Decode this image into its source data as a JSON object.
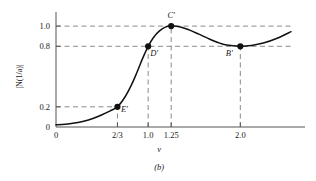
{
  "figure": {
    "caption": "(b)",
    "background": "#ffffff",
    "line_color": "#1a1a1a",
    "dash_color": "#8a8a8a"
  },
  "chart_data": {
    "type": "line",
    "title": "",
    "subtitle": "",
    "xlabel": "v",
    "ylabel": "|N(1/a)|",
    "xlim": [
      0,
      2.55
    ],
    "ylim": [
      0,
      1.12
    ],
    "grid": false,
    "legend": null,
    "xticks": [
      {
        "value": 0,
        "label": "0"
      },
      {
        "value": 0.6667,
        "label": "2/3"
      },
      {
        "value": 1.0,
        "label": "1.0"
      },
      {
        "value": 1.25,
        "label": "1.25"
      },
      {
        "value": 2.0,
        "label": "2.0"
      }
    ],
    "yticks": [
      {
        "value": 0,
        "label": "0"
      },
      {
        "value": 0.2,
        "label": "0.2"
      },
      {
        "value": 0.8,
        "label": "0.8"
      },
      {
        "value": 1.0,
        "label": "1.0"
      }
    ],
    "series": [
      {
        "name": "|N(1/a)|",
        "x": [
          0.0,
          0.1,
          0.2,
          0.3,
          0.4,
          0.5,
          0.5833,
          0.6667,
          0.75,
          0.82,
          0.88,
          0.94,
          1.0,
          1.06,
          1.12,
          1.18,
          1.25,
          1.35,
          1.45,
          1.55,
          1.65,
          1.75,
          1.85,
          2.0,
          2.12,
          2.25,
          2.4,
          2.55
        ],
        "y": [
          0.022,
          0.028,
          0.04,
          0.058,
          0.085,
          0.122,
          0.158,
          0.2,
          0.3,
          0.42,
          0.545,
          0.68,
          0.8,
          0.89,
          0.95,
          0.988,
          1.0,
          0.992,
          0.96,
          0.92,
          0.878,
          0.84,
          0.812,
          0.8,
          0.808,
          0.832,
          0.88,
          0.945
        ]
      }
    ],
    "markers": [
      {
        "id": "E",
        "label": "E'",
        "x": 0.6667,
        "y": 0.2,
        "label_dx": 7,
        "label_dy": 5
      },
      {
        "id": "D",
        "label": "D'",
        "x": 1.0,
        "y": 0.8,
        "label_dx": 6,
        "label_dy": 10
      },
      {
        "id": "C",
        "label": "C'",
        "x": 1.25,
        "y": 1.0,
        "label_dx": 0,
        "label_dy": -8
      },
      {
        "id": "B",
        "label": "B'",
        "x": 2.0,
        "y": 0.8,
        "label_dx": -11,
        "label_dy": 10
      }
    ],
    "guide_lines": [
      {
        "orientation": "horizontal",
        "value": 1.0,
        "from": 0,
        "to": 2.55
      },
      {
        "orientation": "horizontal",
        "value": 0.8,
        "from": 0,
        "to": 2.55
      },
      {
        "orientation": "horizontal",
        "value": 0.2,
        "from": 0,
        "to": 0.6667
      },
      {
        "orientation": "vertical",
        "value": 0.6667,
        "from": 0,
        "to": 0.2
      },
      {
        "orientation": "vertical",
        "value": 1.0,
        "from": 0,
        "to": 0.8
      },
      {
        "orientation": "vertical",
        "value": 1.25,
        "from": 0,
        "to": 1.0
      },
      {
        "orientation": "vertical",
        "value": 2.0,
        "from": 0,
        "to": 0.8
      }
    ]
  }
}
